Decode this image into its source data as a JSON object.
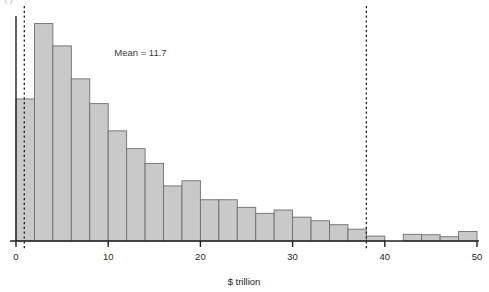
{
  "figure": {
    "top_cropped_caption": "( )",
    "annotation": "Mean = 11.7",
    "xlabel": "$ trillion",
    "bar_fill": "#c9c9c9",
    "bar_stroke": "#6e6e6e",
    "axis_color": "#231f20",
    "dashed_color": "#231f20"
  },
  "chart_data": {
    "type": "bar",
    "title": "",
    "subtitle": "",
    "xlabel": "$ trillion",
    "ylabel": "",
    "xlim": [
      0,
      50
    ],
    "ylim": [
      0,
      1
    ],
    "grid": false,
    "legend": null,
    "bin_width": 2,
    "annotations": [
      {
        "text": "Mean = 11.7",
        "x": 13.5,
        "y": 0.83
      },
      {
        "text": "",
        "kind": "vline",
        "x": 0.9,
        "style": "dashed"
      },
      {
        "text": "",
        "kind": "vline",
        "x": 38.0,
        "style": "dashed"
      }
    ],
    "xticks": [
      0,
      10,
      20,
      30,
      40,
      50
    ],
    "xtick_labels": [
      "0",
      "10",
      "20",
      "30",
      "40",
      "50"
    ],
    "bin_starts": [
      0,
      2,
      4,
      6,
      8,
      10,
      12,
      14,
      16,
      18,
      20,
      22,
      24,
      26,
      28,
      30,
      32,
      34,
      36,
      38,
      40,
      42,
      44,
      46,
      48
    ],
    "categories": [
      "0-2",
      "2-4",
      "4-6",
      "6-8",
      "8-10",
      "10-12",
      "12-14",
      "14-16",
      "16-18",
      "18-20",
      "20-22",
      "22-24",
      "24-26",
      "26-28",
      "28-30",
      "30-32",
      "32-34",
      "34-36",
      "36-38",
      "38-40",
      "40-42",
      "42-44",
      "44-46",
      "46-48",
      "48-50"
    ],
    "values": [
      0.637,
      0.975,
      0.875,
      0.727,
      0.616,
      0.494,
      0.414,
      0.348,
      0.247,
      0.27,
      0.185,
      0.185,
      0.151,
      0.124,
      0.139,
      0.107,
      0.091,
      0.073,
      0.053,
      0.022,
      0.0,
      0.03,
      0.028,
      0.019,
      0.043
    ]
  }
}
